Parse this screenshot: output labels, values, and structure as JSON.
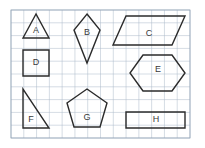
{
  "worksheet": {
    "title": "Geometric shapes on grid paper",
    "background_color": "#ffffff",
    "grid": {
      "line_color": "#aab8c8",
      "border_color": "#93a4b6",
      "cell_size_px": 12.8,
      "columns": 14,
      "rows": 10,
      "origin_x": 11,
      "origin_y": 10,
      "width": 179,
      "height": 128
    },
    "shape_stroke_color": "#2b2b2b",
    "label_color": "#3a3a3a"
  },
  "shapes": [
    {
      "id": "A",
      "label": "A",
      "kind": "triangle-isosceles",
      "points": "36,14 23,38 49,38",
      "label_x": 36,
      "label_y": 31
    },
    {
      "id": "B",
      "label": "B",
      "kind": "kite",
      "points": "87,14 100,30 87,63 74,30",
      "label_x": 87,
      "label_y": 33
    },
    {
      "id": "C",
      "label": "C",
      "kind": "parallelogram",
      "points": "126,16 185,16 172,45 113,45",
      "label_x": 149,
      "label_y": 34
    },
    {
      "id": "D",
      "label": "D",
      "kind": "square",
      "points": "23,50 49,50 49,76 23,76",
      "label_x": 36,
      "label_y": 63
    },
    {
      "id": "E",
      "label": "E",
      "kind": "hexagon",
      "points": "143,55 172,55 185,73 172,91 143,91 130,73",
      "label_x": 158,
      "label_y": 70
    },
    {
      "id": "F",
      "label": "F",
      "kind": "triangle-right",
      "points": "23,89 23,128 49,128",
      "label_x": 31,
      "label_y": 120
    },
    {
      "id": "G",
      "label": "G",
      "kind": "pentagon",
      "points": "87,89 107,103 100,127 74,127 67,103",
      "label_x": 87,
      "label_y": 118
    },
    {
      "id": "H",
      "label": "H",
      "kind": "rectangle",
      "points": "126,112 185,112 185,128 126,128",
      "label_x": 156,
      "label_y": 120
    }
  ]
}
